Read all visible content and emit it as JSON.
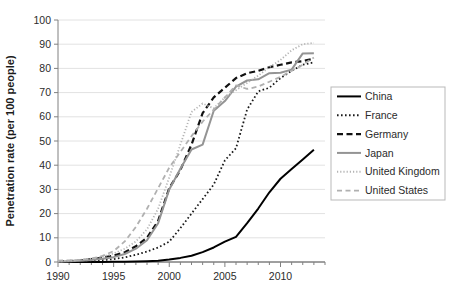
{
  "chart_data": {
    "type": "line",
    "title": "",
    "subtitle": "",
    "xlabel": "",
    "ylabel": "Penetration rate (per 100 people)",
    "xlim": [
      1990,
      2014
    ],
    "ylim": [
      0,
      100
    ],
    "grid": true,
    "grid_axis": "y",
    "legend_position": "right",
    "x_tick_labels": [
      "1990",
      "1995",
      "2000",
      "2005",
      "2010"
    ],
    "x_tick_values": [
      1990,
      1995,
      2000,
      2005,
      2010
    ],
    "x_minor_tick_step": 1,
    "y_tick_labels": [
      "0",
      "10",
      "20",
      "30",
      "40",
      "50",
      "60",
      "70",
      "80",
      "90",
      "100"
    ],
    "y_tick_values": [
      0,
      10,
      20,
      30,
      40,
      50,
      60,
      70,
      80,
      90,
      100
    ],
    "x": [
      1990,
      1991,
      1992,
      1993,
      1994,
      1995,
      1996,
      1997,
      1998,
      1999,
      2000,
      2001,
      2002,
      2003,
      2004,
      2005,
      2006,
      2007,
      2008,
      2009,
      2010,
      2011,
      2012,
      2013
    ],
    "series": [
      {
        "name": "China",
        "style": "solid",
        "color": "#000000",
        "width": 2.0,
        "values": [
          0.0,
          0.0,
          0.0,
          0.0,
          0.0,
          0.1,
          0.1,
          0.2,
          0.3,
          0.5,
          1.0,
          1.7,
          2.6,
          4.1,
          6.0,
          8.4,
          10.4,
          16.1,
          22.1,
          28.8,
          34.4,
          38.4,
          42.4,
          46.4
        ],
        "end_value": 46.4
      },
      {
        "name": "France",
        "style": "dotted",
        "color": "#1a1a1a",
        "width": 1.8,
        "values": [
          0.1,
          0.2,
          0.3,
          0.5,
          0.8,
          1.2,
          1.9,
          3.0,
          4.3,
          6.0,
          8.4,
          14.0,
          20.0,
          26.0,
          32.0,
          42.0,
          47.0,
          63.0,
          70.5,
          72.0,
          76.0,
          79.0,
          81.5,
          82.5
        ],
        "end_value": 82.5
      },
      {
        "name": "Germany",
        "style": "dashed",
        "color": "#111111",
        "width": 2.2,
        "values": [
          0.2,
          0.4,
          0.7,
          1.2,
          1.8,
          2.6,
          4.0,
          6.5,
          10.0,
          17.0,
          30.5,
          38.0,
          48.5,
          61.5,
          68.0,
          72.0,
          76.0,
          78.0,
          79.0,
          80.5,
          81.5,
          82.5,
          83.0,
          84.0
        ],
        "end_value": 84.0
      },
      {
        "name": "Japan",
        "style": "solid",
        "color": "#949494",
        "width": 2.0,
        "values": [
          0.1,
          0.3,
          0.5,
          0.8,
          1.3,
          2.0,
          3.3,
          5.5,
          9.0,
          16.0,
          30.0,
          38.5,
          46.5,
          48.5,
          62.5,
          66.5,
          72.5,
          75.0,
          75.5,
          78.0,
          78.2,
          79.5,
          86.2,
          86.3
        ],
        "end_value": 86.3
      },
      {
        "name": "United Kingdom",
        "style": "fine-dotted",
        "color": "#b4b4b4",
        "width": 1.8,
        "values": [
          0.2,
          0.5,
          0.9,
          1.4,
          2.2,
          3.5,
          5.5,
          8.5,
          13.5,
          22.0,
          35.0,
          48.5,
          62.0,
          65.5,
          63.5,
          68.0,
          71.0,
          74.0,
          77.0,
          80.5,
          83.5,
          87.5,
          90.0,
          90.5
        ],
        "end_value": 90.5
      },
      {
        "name": "United States",
        "style": "dashed",
        "color": "#b0b0b0",
        "width": 1.8,
        "values": [
          0.6,
          0.7,
          0.9,
          1.4,
          2.5,
          4.5,
          8.5,
          14.5,
          22.0,
          30.5,
          39.0,
          45.5,
          52.0,
          58.0,
          63.0,
          68.0,
          73.0,
          71.5,
          72.5,
          74.5,
          76.5,
          79.0,
          81.5,
          84.5
        ],
        "end_value": 84.5
      }
    ]
  },
  "legend": {
    "items": [
      {
        "label": "China"
      },
      {
        "label": "France"
      },
      {
        "label": "Germany"
      },
      {
        "label": "Japan"
      },
      {
        "label": "United Kingdom"
      },
      {
        "label": "United States"
      }
    ]
  },
  "axis": {
    "y_title": "Penetration rate (per 100 people)"
  },
  "colors": {
    "background": "#ffffff",
    "grid": "#e2e2e2",
    "axis": "#808080",
    "text": "#2b2b2b"
  }
}
